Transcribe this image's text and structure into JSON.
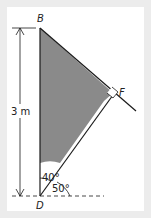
{
  "diagram": {
    "points": {
      "B": "B",
      "F": "F",
      "D": "D"
    },
    "length_label": "3 m",
    "angle_top": "40°",
    "angle_bottom": "50°",
    "colors": {
      "shade": "#8a8a8a",
      "line": "#1a1a1a",
      "frame": "#ececec"
    }
  }
}
